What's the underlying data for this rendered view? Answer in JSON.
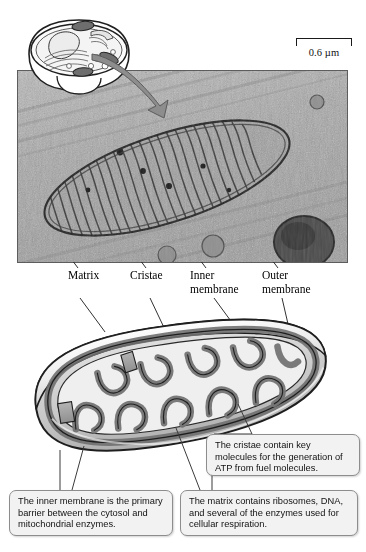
{
  "figure": {
    "background_color": "#ffffff"
  },
  "scale_bar": {
    "label": "0.6 µm",
    "length_px": 56
  },
  "inset": {
    "name": "cell-overview-inset",
    "description": "Cutaway drawing of a eukaryotic cell with organelles"
  },
  "micrograph": {
    "name": "electron-micrograph",
    "description": "Transmission electron micrograph of a mitochondrion with cristae"
  },
  "labels": [
    {
      "id": "matrix",
      "text": "Matrix"
    },
    {
      "id": "cristae",
      "text": "Cristae"
    },
    {
      "id": "inner-membrane",
      "text": "Inner\nmembrane"
    },
    {
      "id": "outer-membrane",
      "text": "Outer\nmembrane"
    }
  ],
  "diagram": {
    "name": "mitochondrion-3d-cutaway"
  },
  "callouts": [
    {
      "id": "cristae-callout",
      "text": "The cristae contain key molecules for the generation of ATP from fuel molecules."
    },
    {
      "id": "inner-membrane-callout",
      "text": "The inner membrane is the primary barrier between the cytosol and mitochondrial enzymes."
    },
    {
      "id": "matrix-callout",
      "text": "The matrix contains ribosomes, DNA, and several of the enzymes used  for cellular respiration."
    }
  ],
  "colors": {
    "callout_fill": "#f2f2f2",
    "callout_border": "#8d8d8d",
    "line": "#1a1a1a",
    "membrane_dark": "#7c7c7c",
    "membrane_mid": "#bcbcbc",
    "membrane_light": "#e8e8e8"
  }
}
